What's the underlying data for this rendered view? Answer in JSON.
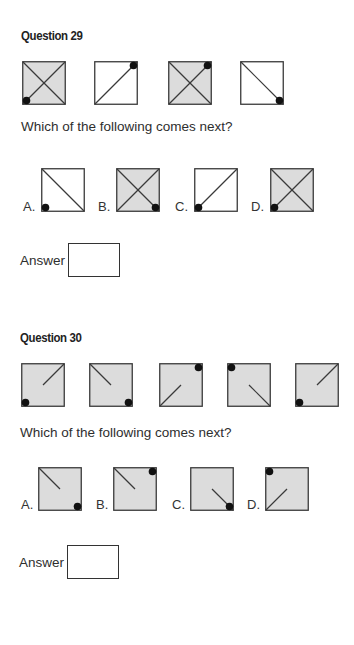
{
  "colors": {
    "shaded": "#dcdcdc",
    "white": "#ffffff",
    "line": "#3a3a3a",
    "dot": "#111111"
  },
  "q29": {
    "title": "Question 29",
    "prompt": "Which of the following comes next?",
    "answer_label": "Answer",
    "sequence": [
      {
        "shaded": true,
        "lines": [
          "tl-br",
          "bl-tr"
        ],
        "dot": "bl"
      },
      {
        "shaded": false,
        "lines": [
          "bl-tr"
        ],
        "dot": "tr"
      },
      {
        "shaded": true,
        "lines": [
          "tl-br",
          "bl-tr"
        ],
        "dot": "tr"
      },
      {
        "shaded": false,
        "lines": [
          "tl-br"
        ],
        "dot": "br"
      }
    ],
    "options": [
      {
        "label": "A.",
        "shaded": false,
        "lines": [
          "tl-br"
        ],
        "dot": "bl"
      },
      {
        "label": "B.",
        "shaded": true,
        "lines": [
          "tl-br",
          "bl-tr"
        ],
        "dot": "br"
      },
      {
        "label": "C.",
        "shaded": false,
        "lines": [
          "bl-tr"
        ],
        "dot": "bl"
      },
      {
        "label": "D.",
        "shaded": true,
        "lines": [
          "tl-br",
          "bl-tr"
        ],
        "dot": "bl"
      }
    ]
  },
  "q30": {
    "title": "Question 30",
    "prompt": "Which of the following comes next?",
    "answer_label": "Answer",
    "sequence": [
      {
        "shaded": true,
        "lines": [
          "tr-half"
        ],
        "dot": "bl"
      },
      {
        "shaded": true,
        "lines": [
          "tl-half"
        ],
        "dot": "br"
      },
      {
        "shaded": true,
        "lines": [
          "bl-half"
        ],
        "dot": "tr"
      },
      {
        "shaded": true,
        "lines": [
          "br-half"
        ],
        "dot": "tl"
      },
      {
        "shaded": true,
        "lines": [
          "tr-half"
        ],
        "dot": "bl"
      }
    ],
    "options": [
      {
        "label": "A.",
        "shaded": true,
        "lines": [
          "tl-half"
        ],
        "dot": "br"
      },
      {
        "label": "B.",
        "shaded": true,
        "lines": [
          "tl-half"
        ],
        "dot": "tr"
      },
      {
        "label": "C.",
        "shaded": true,
        "lines": [
          "br-half"
        ],
        "dot": "br"
      },
      {
        "label": "D.",
        "shaded": true,
        "lines": [
          "bl-half"
        ],
        "dot": "tl"
      }
    ]
  }
}
